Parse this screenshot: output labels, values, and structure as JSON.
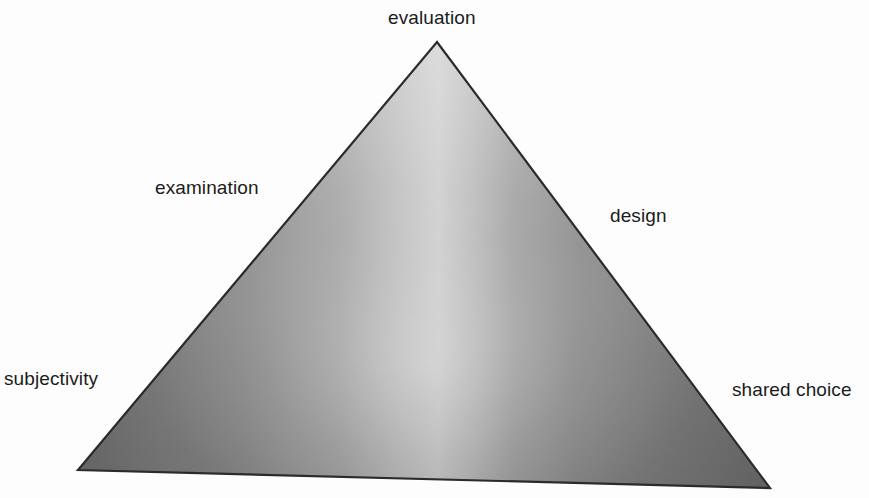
{
  "diagram": {
    "type": "triangle-model",
    "title": "",
    "background_color": "#fdfdfd",
    "outline_color": "#2b2b2b",
    "fill_light": "#d2d2d2",
    "fill_mid": "#9a9a9a",
    "fill_dark": "#6e6e6e",
    "vertices": {
      "apex": {
        "x": 437,
        "y": 42
      },
      "bottom_left": {
        "x": 78,
        "y": 470
      },
      "bottom_right": {
        "x": 770,
        "y": 488
      }
    },
    "labels": [
      {
        "id": "evaluation",
        "text": "evaluation",
        "position": "apex-top",
        "x": 388,
        "y": 7
      },
      {
        "id": "examination",
        "text": "examination",
        "position": "upper-left-edge",
        "x": 155,
        "y": 177
      },
      {
        "id": "design",
        "text": "design",
        "position": "upper-right-edge",
        "x": 610,
        "y": 205
      },
      {
        "id": "subjectivity",
        "text": "subjectivity",
        "position": "bottom-left-vertex",
        "x": 4,
        "y": 368
      },
      {
        "id": "shared-choice",
        "text": "shared choice",
        "position": "bottom-right-vertex",
        "x": 732,
        "y": 379
      }
    ]
  }
}
